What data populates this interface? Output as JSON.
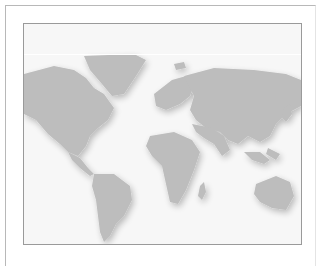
{
  "image": {
    "subject": "world-map",
    "land_color": "#bdbdbd",
    "background_color": "#f7f7f7",
    "frame_color": "#9a9a9a"
  }
}
